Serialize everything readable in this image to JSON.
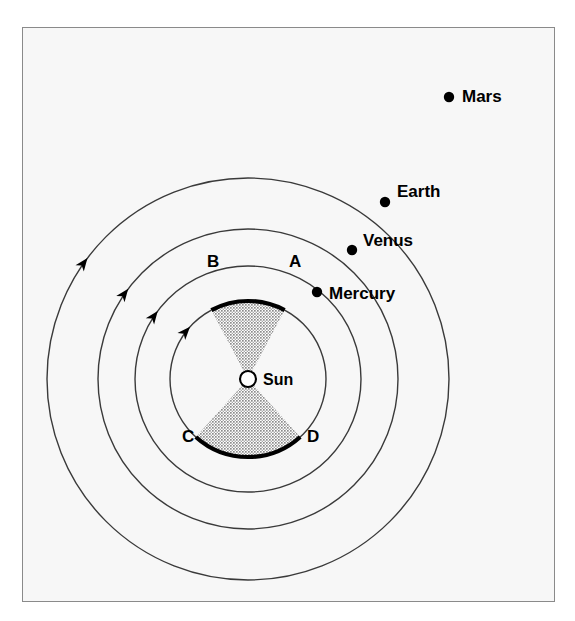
{
  "figure": {
    "kind": "solar-system-kepler-equal-areas-diagram",
    "background_color": "#f7f7f7",
    "frame_color": "#8a8a8a",
    "line_color": "#3a3a3a",
    "shade_color": "#999999",
    "highlight_color": "#000000"
  },
  "center": {
    "label": "Sun",
    "x": 247,
    "y": 378,
    "radius": 8
  },
  "orbits": [
    {
      "name": "Mercury",
      "radius": 78,
      "arrow_angle_deg": 138,
      "direction": "counterclockwise"
    },
    {
      "name": "Venus",
      "radius": 113,
      "arrow_angle_deg": 143,
      "direction": "counterclockwise"
    },
    {
      "name": "Earth",
      "radius": 150,
      "arrow_angle_deg": 143,
      "direction": "counterclockwise"
    },
    {
      "name": "Mars",
      "radius": 201,
      "arrow_angle_deg": 143,
      "direction": "counterclockwise"
    }
  ],
  "planets": [
    {
      "label": "Mars",
      "dot_x": 448,
      "dot_y": 96,
      "label_x": 461,
      "label_y": 101,
      "orbit_radius": 201
    },
    {
      "label": "Earth",
      "dot_x": 384,
      "dot_y": 201,
      "label_x": 396,
      "label_y": 196,
      "orbit_radius": 150
    },
    {
      "label": "Venus",
      "dot_x": 351,
      "dot_y": 249,
      "label_x": 362,
      "label_y": 245,
      "orbit_radius": 113
    },
    {
      "label": "Mercury",
      "dot_x": 316,
      "dot_y": 291,
      "label_x": 328,
      "label_y": 298,
      "orbit_radius": 78
    }
  ],
  "sectors": [
    {
      "id": "upper-sector",
      "start_point": "A",
      "end_point": "B",
      "start_angle_deg": 62,
      "end_angle_deg": 118,
      "shaded": true,
      "arc_emphasized": true
    },
    {
      "id": "lower-sector",
      "start_point": "C",
      "end_point": "D",
      "start_angle_deg": 228,
      "end_angle_deg": 312,
      "shaded": true,
      "arc_emphasized": true
    }
  ],
  "point_labels": [
    {
      "text": "A",
      "x": 288,
      "y": 266
    },
    {
      "text": "B",
      "x": 206,
      "y": 266
    },
    {
      "text": "C",
      "x": 181,
      "y": 441
    },
    {
      "text": "D",
      "x": 306,
      "y": 441
    }
  ],
  "sun_label": {
    "text": "Sun",
    "x": 262,
    "y": 384
  }
}
